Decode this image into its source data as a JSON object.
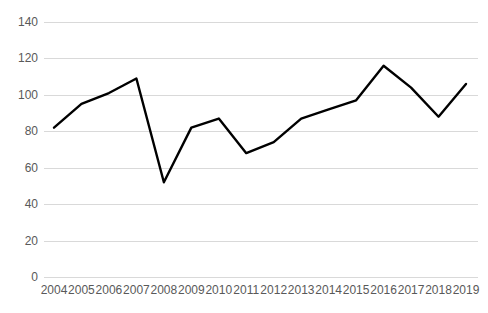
{
  "chart_data": {
    "type": "line",
    "title": "",
    "subtitle": "",
    "xlabel": "",
    "ylabel": "",
    "categories": [
      "2004",
      "2005",
      "2006",
      "2007",
      "2008",
      "2009",
      "2010",
      "2011",
      "2012",
      "2013",
      "2014",
      "2015",
      "2016",
      "2017",
      "2018",
      "2019"
    ],
    "series": [
      {
        "name": "Series 1",
        "values": [
          82,
          95,
          101,
          109,
          52,
          82,
          87,
          68,
          74,
          87,
          92,
          97,
          116,
          104,
          88,
          106
        ],
        "color": "#000000",
        "line_width": 2.4,
        "markers": false
      }
    ],
    "ylim": [
      0,
      140
    ],
    "yticks": [
      0,
      20,
      40,
      60,
      80,
      100,
      120,
      140
    ],
    "ytick_labels": [
      "0",
      "20",
      "40",
      "60",
      "80",
      "100",
      "120",
      "140"
    ],
    "xtick_labels": [
      "2004",
      "2005",
      "2006",
      "2007",
      "2008",
      "2009",
      "2010",
      "2011",
      "2012",
      "2013",
      "2014",
      "2015",
      "2016",
      "2017",
      "2018",
      "2019"
    ],
    "grid": {
      "horizontal": true,
      "vertical": false,
      "color": "#d9d9d9"
    },
    "legend": {
      "visible": false,
      "position": "none",
      "entries": []
    },
    "axis_label_color": "#595959",
    "background_color": "#ffffff",
    "annotations": []
  }
}
